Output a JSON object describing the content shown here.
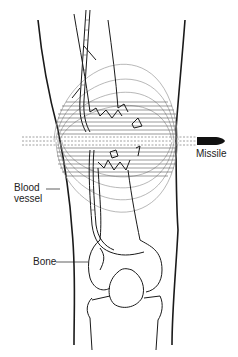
{
  "diagram": {
    "labels": {
      "missile": "Missile",
      "blood_vessel_line1": "Blood",
      "blood_vessel_line2": "vessel",
      "bone": "Bone",
      "caption_fragment": "B  b  l  a  ..."
    },
    "colors": {
      "line": "#1a1a1a",
      "cavity_lines": "#9a9a9a",
      "hatch": "#555555",
      "background": "#ffffff"
    }
  }
}
